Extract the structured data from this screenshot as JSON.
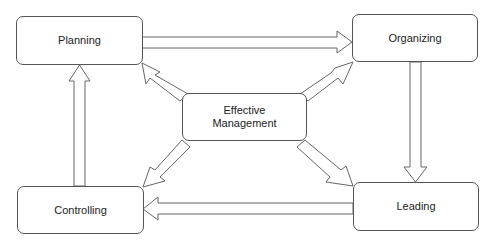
{
  "diagram": {
    "nodes": [
      {
        "id": "planning",
        "label": "Planning"
      },
      {
        "id": "organizing",
        "label": "Organizing"
      },
      {
        "id": "leading",
        "label": "Leading"
      },
      {
        "id": "controlling",
        "label": "Controlling"
      },
      {
        "id": "center",
        "label_line1": "Effective",
        "label_line2": "Management"
      }
    ],
    "edges": [
      {
        "from": "planning",
        "to": "organizing"
      },
      {
        "from": "organizing",
        "to": "leading"
      },
      {
        "from": "leading",
        "to": "controlling"
      },
      {
        "from": "controlling",
        "to": "planning"
      },
      {
        "from": "center",
        "to": "planning"
      },
      {
        "from": "center",
        "to": "organizing"
      },
      {
        "from": "center",
        "to": "leading"
      },
      {
        "from": "center",
        "to": "controlling"
      }
    ],
    "colors": {
      "border": "#555555",
      "arrow_stroke": "#666666",
      "background": "#ffffff"
    }
  }
}
